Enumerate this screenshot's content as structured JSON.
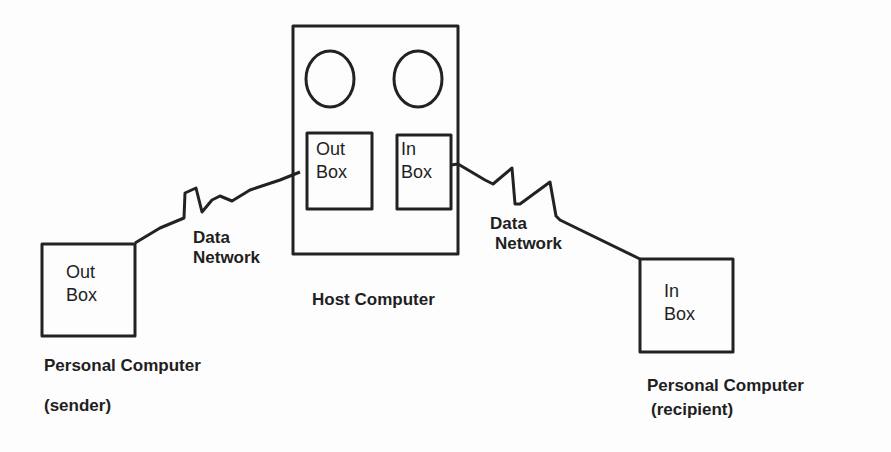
{
  "diagram": {
    "colors": {
      "stroke": "#222222",
      "background": "#fdfdfd"
    },
    "host": {
      "label": "Host Computer",
      "outbox": {
        "line1": "Out",
        "line2": "Box"
      },
      "inbox": {
        "line1": "In",
        "line2": "Box"
      }
    },
    "sender": {
      "box": {
        "line1": "Out",
        "line2": "Box"
      },
      "label": "Personal Computer",
      "sublabel": "(sender)"
    },
    "recipient": {
      "box": {
        "line1": "In",
        "line2": "Box"
      },
      "label": "Personal Computer",
      "sublabel": "(recipient)"
    },
    "network_left": {
      "line1": "Data",
      "line2": "Network"
    },
    "network_right": {
      "line1": "Data",
      "line2": "Network"
    }
  }
}
